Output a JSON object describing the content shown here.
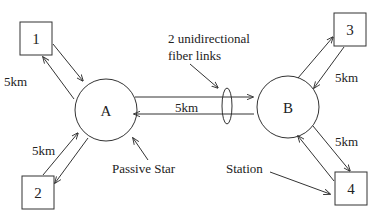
{
  "diagram": {
    "stations": [
      {
        "id": "1",
        "label": "1"
      },
      {
        "id": "2",
        "label": "2"
      },
      {
        "id": "3",
        "label": "3"
      },
      {
        "id": "4",
        "label": "4"
      }
    ],
    "stars": [
      {
        "id": "A",
        "label": "A"
      },
      {
        "id": "B",
        "label": "B"
      }
    ],
    "links": [
      {
        "from": "1",
        "to": "A",
        "distance": "5km"
      },
      {
        "from": "2",
        "to": "A",
        "distance": "5km"
      },
      {
        "from": "A",
        "to": "B",
        "distance": "5km"
      },
      {
        "from": "3",
        "to": "B",
        "distance": "5km"
      },
      {
        "from": "4",
        "to": "B",
        "distance": "5km"
      }
    ],
    "annotations": {
      "fiber_line1": "2 unidirectional",
      "fiber_line2": "fiber links",
      "passive_star": "Passive Star",
      "station": "Station"
    },
    "colors": {
      "stroke": "#333333",
      "text": "#222222",
      "background": "#ffffff"
    }
  }
}
